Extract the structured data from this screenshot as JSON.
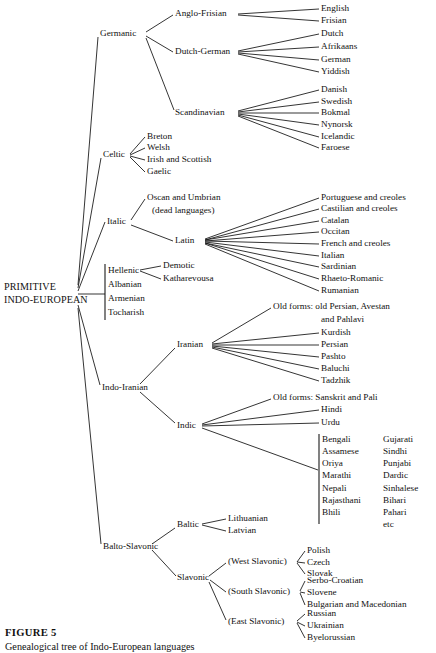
{
  "figure": {
    "caption_title": "FIGURE 5",
    "caption_subtitle": "Genealogical tree of Indo-European languages",
    "line_color": "#111111",
    "text_color": "#111111",
    "background_color": "#ffffff"
  },
  "root": {
    "line1": "PRIMITIVE",
    "line2": "INDO-EUROPEAN",
    "x": 4,
    "y1": 288,
    "y2": 301
  },
  "nodes": [
    {
      "id": "germanic",
      "label": "Germanic",
      "x": 100,
      "y": 34,
      "anchor": "start"
    },
    {
      "id": "anglo-frisian",
      "label": "Anglo-Frisian",
      "x": 175,
      "y": 14,
      "anchor": "start"
    },
    {
      "id": "dutch-german",
      "label": "Dutch-German",
      "x": 175,
      "y": 52,
      "anchor": "start"
    },
    {
      "id": "scandinavian",
      "label": "Scandinavian",
      "x": 175,
      "y": 113,
      "anchor": "start"
    },
    {
      "id": "celtic",
      "label": "Celtic",
      "x": 103,
      "y": 155,
      "anchor": "start"
    },
    {
      "id": "italic",
      "label": "Italic",
      "x": 107,
      "y": 222,
      "anchor": "start"
    },
    {
      "id": "latin",
      "label": "Latin",
      "x": 175,
      "y": 241,
      "anchor": "start"
    },
    {
      "id": "hellenic",
      "label": "Hellenic",
      "x": 108,
      "y": 271,
      "anchor": "start"
    },
    {
      "id": "albanian",
      "label": "Albanian",
      "x": 108,
      "y": 285,
      "anchor": "start"
    },
    {
      "id": "armenian",
      "label": "Armenian",
      "x": 108,
      "y": 299,
      "anchor": "start"
    },
    {
      "id": "tocharish",
      "label": "Tocharish",
      "x": 108,
      "y": 313,
      "anchor": "start"
    },
    {
      "id": "indo-iranian",
      "label": "Indo-Iranian",
      "x": 102,
      "y": 388,
      "anchor": "start"
    },
    {
      "id": "iranian",
      "label": "Iranian",
      "x": 177,
      "y": 345,
      "anchor": "start"
    },
    {
      "id": "indic",
      "label": "Indic",
      "x": 177,
      "y": 426,
      "anchor": "start"
    },
    {
      "id": "balto-slavonic",
      "label": "Balto-Slavonic",
      "x": 103,
      "y": 547,
      "anchor": "start"
    },
    {
      "id": "baltic",
      "label": "Baltic",
      "x": 177,
      "y": 525,
      "anchor": "start"
    },
    {
      "id": "slavonic",
      "label": "Slavonic",
      "x": 177,
      "y": 578,
      "anchor": "start"
    },
    {
      "id": "west-slavonic",
      "label": "(West Slavonic)",
      "x": 228,
      "y": 562,
      "anchor": "start"
    },
    {
      "id": "south-slavonic",
      "label": "(South Slavonic)",
      "x": 228,
      "y": 592,
      "anchor": "start"
    },
    {
      "id": "east-slavonic",
      "label": "(East Slavonic)",
      "x": 228,
      "y": 622,
      "anchor": "start"
    }
  ],
  "leaves": [
    {
      "id": "english",
      "label": "English",
      "x": 321,
      "y": 9
    },
    {
      "id": "frisian",
      "label": "Frisian",
      "x": 321,
      "y": 21
    },
    {
      "id": "dutch",
      "label": "Dutch",
      "x": 321,
      "y": 34
    },
    {
      "id": "afrikaans",
      "label": "Afrikaans",
      "x": 321,
      "y": 47
    },
    {
      "id": "german",
      "label": "German",
      "x": 321,
      "y": 60
    },
    {
      "id": "yiddish",
      "label": "Yiddish",
      "x": 321,
      "y": 72
    },
    {
      "id": "danish",
      "label": "Danish",
      "x": 321,
      "y": 90
    },
    {
      "id": "swedish",
      "label": "Swedish",
      "x": 321,
      "y": 102
    },
    {
      "id": "bokmal",
      "label": "Bokmal",
      "x": 321,
      "y": 113
    },
    {
      "id": "nynorsk",
      "label": "Nynorsk",
      "x": 321,
      "y": 125
    },
    {
      "id": "icelandic",
      "label": "Icelandic",
      "x": 321,
      "y": 137
    },
    {
      "id": "faroese",
      "label": "Faroese",
      "x": 321,
      "y": 148
    },
    {
      "id": "breton",
      "label": "Breton",
      "x": 147,
      "y": 137
    },
    {
      "id": "welsh",
      "label": "Welsh",
      "x": 147,
      "y": 148
    },
    {
      "id": "irish-and-scottish",
      "label": "Irish and Scottish",
      "x": 147,
      "y": 160
    },
    {
      "id": "gaelic",
      "label": "Gaelic",
      "x": 147,
      "y": 172
    },
    {
      "id": "oscan-umbrian",
      "label": "Oscan and Umbrian",
      "x": 147,
      "y": 198
    },
    {
      "id": "dead-languages",
      "label": "(dead languages)",
      "x": 152,
      "y": 211
    },
    {
      "id": "portuguese",
      "label": "Portuguese and creoles",
      "x": 321,
      "y": 198
    },
    {
      "id": "castilian",
      "label": "Castilian and creoles",
      "x": 321,
      "y": 209
    },
    {
      "id": "catalan",
      "label": "Catalan",
      "x": 321,
      "y": 221
    },
    {
      "id": "occitan",
      "label": "Occitan",
      "x": 321,
      "y": 232
    },
    {
      "id": "french",
      "label": "French and creoles",
      "x": 321,
      "y": 244
    },
    {
      "id": "italian",
      "label": "Italian",
      "x": 321,
      "y": 256
    },
    {
      "id": "sardinian",
      "label": "Sardinian",
      "x": 321,
      "y": 267
    },
    {
      "id": "rhaeto-romanic",
      "label": "Rhaeto-Romanic",
      "x": 321,
      "y": 279
    },
    {
      "id": "rumanian",
      "label": "Rumanian",
      "x": 321,
      "y": 291
    },
    {
      "id": "demotic",
      "label": "Demotic",
      "x": 163,
      "y": 266
    },
    {
      "id": "katharevousa",
      "label": "Katharevousa",
      "x": 163,
      "y": 279
    },
    {
      "id": "iranian-old-1",
      "label": "Old forms: old Persian, Avestan",
      "x": 273,
      "y": 307
    },
    {
      "id": "iranian-old-2",
      "label": "and Pahlavi",
      "x": 321,
      "y": 320
    },
    {
      "id": "kurdish",
      "label": "Kurdish",
      "x": 321,
      "y": 333
    },
    {
      "id": "persian",
      "label": "Persian",
      "x": 321,
      "y": 345
    },
    {
      "id": "pashto",
      "label": "Pashto",
      "x": 321,
      "y": 357
    },
    {
      "id": "baluchi",
      "label": "Baluchi",
      "x": 321,
      "y": 369
    },
    {
      "id": "tadzhik",
      "label": "Tadzhik",
      "x": 321,
      "y": 381
    },
    {
      "id": "indic-old",
      "label": "Old forms: Sanskrit and Pali",
      "x": 273,
      "y": 398
    },
    {
      "id": "hindi",
      "label": "Hindi",
      "x": 321,
      "y": 410
    },
    {
      "id": "urdu",
      "label": "Urdu",
      "x": 321,
      "y": 423
    },
    {
      "id": "lithuanian",
      "label": "Lithuanian",
      "x": 228,
      "y": 519
    },
    {
      "id": "latvian",
      "label": "Latvian",
      "x": 228,
      "y": 531
    },
    {
      "id": "polish",
      "label": "Polish",
      "x": 307,
      "y": 551
    },
    {
      "id": "czech",
      "label": "Czech",
      "x": 307,
      "y": 563
    },
    {
      "id": "slovak",
      "label": "Slovak",
      "x": 307,
      "y": 574
    },
    {
      "id": "serbo-croatian",
      "label": "Serbo-Croatian",
      "x": 307,
      "y": 581
    },
    {
      "id": "slovene",
      "label": "Slovene",
      "x": 307,
      "y": 593
    },
    {
      "id": "bulgarian",
      "label": "Bulgarian and Macedonian",
      "x": 307,
      "y": 605
    },
    {
      "id": "russian",
      "label": "Russian",
      "x": 307,
      "y": 614
    },
    {
      "id": "ukrainian",
      "label": "Ukrainian",
      "x": 307,
      "y": 626
    },
    {
      "id": "byelorussian",
      "label": "Byelorussian",
      "x": 307,
      "y": 638
    }
  ],
  "indic_columns": {
    "bracket_x": 319,
    "bracket_y1": 434,
    "bracket_y2": 524,
    "col1_x": 322,
    "col2_x": 383,
    "row_start_y": 440,
    "row_step": 12.1,
    "col1": [
      "Bengali",
      "Assamese",
      "Oriya",
      "Marathi",
      "Nepali",
      "Rajasthani",
      "Bhili"
    ],
    "col2": [
      "Gujarati",
      "Sindhi",
      "Punjabi",
      "Dardic",
      "Sinhalese",
      "Bihari",
      "Pahari",
      "etc"
    ]
  },
  "hellenic_bracket": {
    "x": 105,
    "y1": 264,
    "y2": 320
  },
  "edges": [
    {
      "id": "root-germanic",
      "x1": 78,
      "y1": 285,
      "x2": 98,
      "y2": 37
    },
    {
      "id": "root-celtic",
      "x1": 78,
      "y1": 288,
      "x2": 101,
      "y2": 158
    },
    {
      "id": "root-italic",
      "x1": 78,
      "y1": 291,
      "x2": 105,
      "y2": 222
    },
    {
      "id": "root-hellenic-group",
      "x1": 78,
      "y1": 294,
      "x2": 105,
      "y2": 294
    },
    {
      "id": "root-indo-iranian",
      "x1": 78,
      "y1": 305,
      "x2": 100,
      "y2": 385
    },
    {
      "id": "root-balto-slavonic",
      "x1": 78,
      "y1": 308,
      "x2": 101,
      "y2": 544
    },
    {
      "id": "germanic-anglo",
      "x1": 146,
      "y1": 32,
      "x2": 173,
      "y2": 15
    },
    {
      "id": "germanic-dutch",
      "x1": 146,
      "y1": 36,
      "x2": 173,
      "y2": 52
    },
    {
      "id": "germanic-scand",
      "x1": 146,
      "y1": 38,
      "x2": 174,
      "y2": 110
    },
    {
      "id": "anglo-english",
      "x1": 238,
      "y1": 14,
      "x2": 319,
      "y2": 9
    },
    {
      "id": "anglo-frisian-leaf",
      "x1": 238,
      "y1": 15,
      "x2": 319,
      "y2": 21
    },
    {
      "id": "dg-dutch",
      "x1": 238,
      "y1": 51,
      "x2": 319,
      "y2": 34
    },
    {
      "id": "dg-afrikaans",
      "x1": 238,
      "y1": 52,
      "x2": 319,
      "y2": 47
    },
    {
      "id": "dg-german",
      "x1": 238,
      "y1": 53,
      "x2": 319,
      "y2": 60
    },
    {
      "id": "dg-yiddish",
      "x1": 238,
      "y1": 54,
      "x2": 319,
      "y2": 72
    },
    {
      "id": "sc-danish",
      "x1": 238,
      "y1": 111,
      "x2": 319,
      "y2": 90
    },
    {
      "id": "sc-swedish",
      "x1": 238,
      "y1": 112,
      "x2": 319,
      "y2": 102
    },
    {
      "id": "sc-bokmal",
      "x1": 238,
      "y1": 113,
      "x2": 319,
      "y2": 113
    },
    {
      "id": "sc-nynorsk",
      "x1": 238,
      "y1": 114,
      "x2": 319,
      "y2": 125
    },
    {
      "id": "sc-icelandic",
      "x1": 238,
      "y1": 115,
      "x2": 319,
      "y2": 137
    },
    {
      "id": "sc-faroese",
      "x1": 238,
      "y1": 116,
      "x2": 319,
      "y2": 148
    },
    {
      "id": "celtic-breton",
      "x1": 130,
      "y1": 154,
      "x2": 145,
      "y2": 137
    },
    {
      "id": "celtic-welsh",
      "x1": 130,
      "y1": 155,
      "x2": 145,
      "y2": 148
    },
    {
      "id": "celtic-irish",
      "x1": 130,
      "y1": 156,
      "x2": 145,
      "y2": 160
    },
    {
      "id": "celtic-gaelic",
      "x1": 130,
      "y1": 157,
      "x2": 145,
      "y2": 172
    },
    {
      "id": "italic-oscan",
      "x1": 131,
      "y1": 220,
      "x2": 145,
      "y2": 199
    },
    {
      "id": "italic-latin",
      "x1": 131,
      "y1": 225,
      "x2": 173,
      "y2": 241
    },
    {
      "id": "latin-portuguese",
      "x1": 205,
      "y1": 239,
      "x2": 319,
      "y2": 198
    },
    {
      "id": "latin-castilian",
      "x1": 205,
      "y1": 240,
      "x2": 319,
      "y2": 209
    },
    {
      "id": "latin-catalan",
      "x1": 205,
      "y1": 240,
      "x2": 319,
      "y2": 221
    },
    {
      "id": "latin-occitan",
      "x1": 205,
      "y1": 241,
      "x2": 319,
      "y2": 232
    },
    {
      "id": "latin-french",
      "x1": 205,
      "y1": 241,
      "x2": 319,
      "y2": 244
    },
    {
      "id": "latin-italian",
      "x1": 205,
      "y1": 242,
      "x2": 319,
      "y2": 256
    },
    {
      "id": "latin-sardinian",
      "x1": 205,
      "y1": 243,
      "x2": 319,
      "y2": 267
    },
    {
      "id": "latin-rhaeto",
      "x1": 205,
      "y1": 243,
      "x2": 319,
      "y2": 279
    },
    {
      "id": "latin-rumanian",
      "x1": 205,
      "y1": 244,
      "x2": 319,
      "y2": 291
    },
    {
      "id": "hellenic-demotic",
      "x1": 140,
      "y1": 270,
      "x2": 161,
      "y2": 266
    },
    {
      "id": "hellenic-kathar",
      "x1": 140,
      "y1": 271,
      "x2": 161,
      "y2": 279
    },
    {
      "id": "ii-iranian",
      "x1": 140,
      "y1": 384,
      "x2": 175,
      "y2": 348
    },
    {
      "id": "ii-indic",
      "x1": 140,
      "y1": 392,
      "x2": 175,
      "y2": 423
    },
    {
      "id": "iranian-old",
      "x1": 212,
      "y1": 343,
      "x2": 271,
      "y2": 308
    },
    {
      "id": "iranian-kurdish",
      "x1": 212,
      "y1": 344,
      "x2": 319,
      "y2": 333
    },
    {
      "id": "iranian-persian",
      "x1": 212,
      "y1": 345,
      "x2": 319,
      "y2": 345
    },
    {
      "id": "iranian-pashto",
      "x1": 212,
      "y1": 346,
      "x2": 319,
      "y2": 357
    },
    {
      "id": "iranian-baluchi",
      "x1": 212,
      "y1": 347,
      "x2": 319,
      "y2": 369
    },
    {
      "id": "iranian-tadzhik",
      "x1": 212,
      "y1": 348,
      "x2": 319,
      "y2": 381
    },
    {
      "id": "indic-old-edge",
      "x1": 202,
      "y1": 424,
      "x2": 271,
      "y2": 399
    },
    {
      "id": "indic-hindi",
      "x1": 202,
      "y1": 425,
      "x2": 319,
      "y2": 410
    },
    {
      "id": "indic-urdu",
      "x1": 202,
      "y1": 426,
      "x2": 319,
      "y2": 423
    },
    {
      "id": "indic-group",
      "x1": 202,
      "y1": 428,
      "x2": 318,
      "y2": 470
    },
    {
      "id": "bs-baltic",
      "x1": 152,
      "y1": 544,
      "x2": 175,
      "y2": 528
    },
    {
      "id": "bs-slavonic",
      "x1": 152,
      "y1": 550,
      "x2": 176,
      "y2": 576
    },
    {
      "id": "baltic-lith",
      "x1": 202,
      "y1": 524,
      "x2": 226,
      "y2": 519
    },
    {
      "id": "baltic-latvian",
      "x1": 202,
      "y1": 525,
      "x2": 226,
      "y2": 531
    },
    {
      "id": "slav-west",
      "x1": 209,
      "y1": 576,
      "x2": 226,
      "y2": 563
    },
    {
      "id": "slav-south",
      "x1": 210,
      "y1": 580,
      "x2": 226,
      "y2": 592
    },
    {
      "id": "slav-east",
      "x1": 209,
      "y1": 582,
      "x2": 226,
      "y2": 620
    },
    {
      "id": "west-polish",
      "x1": 297,
      "y1": 562,
      "x2": 305,
      "y2": 551
    },
    {
      "id": "west-czech",
      "x1": 297,
      "y1": 562,
      "x2": 305,
      "y2": 563
    },
    {
      "id": "west-slovak",
      "x1": 297,
      "y1": 563,
      "x2": 305,
      "y2": 574
    },
    {
      "id": "south-serbo",
      "x1": 300,
      "y1": 591,
      "x2": 305,
      "y2": 581
    },
    {
      "id": "south-slovene",
      "x1": 300,
      "y1": 592,
      "x2": 305,
      "y2": 593
    },
    {
      "id": "south-bulgarian",
      "x1": 300,
      "y1": 593,
      "x2": 305,
      "y2": 605
    },
    {
      "id": "east-russian",
      "x1": 297,
      "y1": 621,
      "x2": 305,
      "y2": 614
    },
    {
      "id": "east-ukrainian",
      "x1": 297,
      "y1": 622,
      "x2": 305,
      "y2": 626
    },
    {
      "id": "east-byelorussian",
      "x1": 297,
      "y1": 623,
      "x2": 305,
      "y2": 638
    }
  ]
}
